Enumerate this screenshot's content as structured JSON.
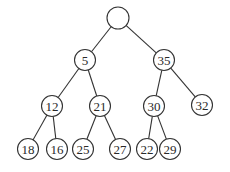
{
  "diagram": {
    "type": "binary-tree",
    "radius": 10.5,
    "nodes": [
      {
        "id": "root",
        "label": "",
        "x": 118,
        "y": 18
      },
      {
        "id": "n5",
        "label": "5",
        "x": 85,
        "y": 60
      },
      {
        "id": "n35",
        "label": "35",
        "x": 164,
        "y": 60
      },
      {
        "id": "n12",
        "label": "12",
        "x": 52,
        "y": 106
      },
      {
        "id": "n21",
        "label": "21",
        "x": 100,
        "y": 106
      },
      {
        "id": "n30",
        "label": "30",
        "x": 154,
        "y": 106
      },
      {
        "id": "n32",
        "label": "32",
        "x": 202,
        "y": 105
      },
      {
        "id": "n18",
        "label": "18",
        "x": 28,
        "y": 149
      },
      {
        "id": "n16",
        "label": "16",
        "x": 57,
        "y": 149
      },
      {
        "id": "n25",
        "label": "25",
        "x": 83,
        "y": 149
      },
      {
        "id": "n27",
        "label": "27",
        "x": 120,
        "y": 149
      },
      {
        "id": "n22",
        "label": "22",
        "x": 147,
        "y": 149
      },
      {
        "id": "n29",
        "label": "29",
        "x": 170,
        "y": 149
      }
    ],
    "edges": [
      [
        "root",
        "n5"
      ],
      [
        "root",
        "n35"
      ],
      [
        "n5",
        "n12"
      ],
      [
        "n5",
        "n21"
      ],
      [
        "n35",
        "n30"
      ],
      [
        "n35",
        "n32"
      ],
      [
        "n12",
        "n18"
      ],
      [
        "n12",
        "n16"
      ],
      [
        "n21",
        "n25"
      ],
      [
        "n21",
        "n27"
      ],
      [
        "n30",
        "n22"
      ],
      [
        "n30",
        "n29"
      ]
    ]
  }
}
